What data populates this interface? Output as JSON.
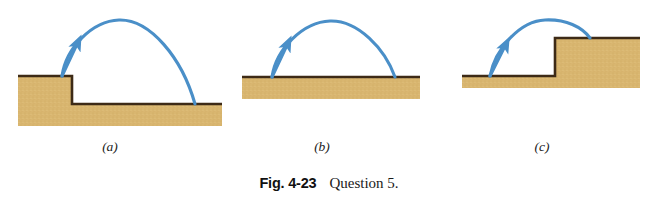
{
  "figure": {
    "caption_label": "Fig. 4-23",
    "caption_text": "Question 5.",
    "background_color": "#ffffff"
  },
  "style": {
    "ground_fill": "#d9b670",
    "ground_fill_dark": "#cfa85e",
    "ground_edge": "#3d2a16",
    "trajectory_color": "#4a8fc8",
    "trajectory_color_dark": "#3f7fb4",
    "label_color": "#1a1a1a"
  },
  "panels": [
    {
      "id": "a",
      "label": "(a)",
      "terrain_type": "step-down",
      "description": "Ball launched from the edge of a raised ledge lands on lower ground to the right.",
      "ground_outline": "M 18,76 L 72,76 L 72,104 L 222,104 L 222,126 L 18,126 Z",
      "ground_top_edges": [
        {
          "x1": 18,
          "y1": 76,
          "x2": 72,
          "y2": 76
        },
        {
          "x1": 72,
          "y1": 76,
          "x2": 72,
          "y2": 104
        },
        {
          "x1": 72,
          "y1": 104,
          "x2": 222,
          "y2": 104
        }
      ],
      "trajectory": {
        "launch": {
          "x": 62,
          "y": 76
        },
        "apex": {
          "x": 119,
          "y": 20
        },
        "landing": {
          "x": 195,
          "y": 104
        },
        "path": "M 62,76 C 66,48 92,21 119,20 C 150,19 182,58 195,104",
        "arrow": {
          "x": 76,
          "y": 45,
          "angle": -52
        }
      }
    },
    {
      "id": "b",
      "label": "(b)",
      "terrain_type": "flat",
      "description": "Ball launched from flat ground lands on the same level ground.",
      "ground_outline": "M 242,77 L 420,77 L 420,99 L 242,99 Z",
      "ground_top_edges": [
        {
          "x1": 242,
          "y1": 77,
          "x2": 420,
          "y2": 77
        }
      ],
      "trajectory": {
        "launch": {
          "x": 272,
          "y": 77
        },
        "apex": {
          "x": 330,
          "y": 21
        },
        "landing": {
          "x": 395,
          "y": 77
        },
        "path": "M 272,77 C 276,49 303,22 330,21 C 358,20 385,49 395,77",
        "arrow": {
          "x": 287,
          "y": 45,
          "angle": -52
        }
      }
    },
    {
      "id": "c",
      "label": "(c)",
      "terrain_type": "step-up",
      "description": "Ball launched from lower ground lands on a raised ledge to the right.",
      "ground_outline": "M 462,76 L 555,76 L 555,38 L 640,38 L 640,88 L 462,88 Z",
      "ground_top_edges": [
        {
          "x1": 462,
          "y1": 76,
          "x2": 555,
          "y2": 76
        },
        {
          "x1": 555,
          "y1": 76,
          "x2": 555,
          "y2": 38
        },
        {
          "x1": 555,
          "y1": 38,
          "x2": 640,
          "y2": 38
        }
      ],
      "trajectory": {
        "launch": {
          "x": 490,
          "y": 76
        },
        "apex": {
          "x": 545,
          "y": 20
        },
        "landing": {
          "x": 590,
          "y": 38
        },
        "path": "M 490,76 C 495,49 520,21 545,20 C 566,19 582,27 590,38",
        "arrow": {
          "x": 505,
          "y": 46,
          "angle": -55
        }
      }
    }
  ]
}
